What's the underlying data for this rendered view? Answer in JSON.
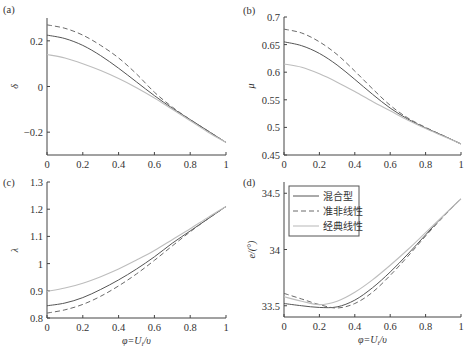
{
  "chart_data": [
    {
      "type": "line",
      "panel_label": "(a)",
      "title": "",
      "xlabel": "",
      "ylabel": "δ",
      "xlim": [
        0,
        1
      ],
      "ylim": [
        -0.3,
        0.3
      ],
      "xticks": [
        "0",
        "0.2",
        "0.4",
        "0.6",
        "0.8",
        "1"
      ],
      "yticks": [
        {
          "v": 0.2,
          "label": "0.2"
        },
        {
          "v": 0,
          "label": "0"
        },
        {
          "v": -0.2,
          "label": "−0.2"
        }
      ],
      "x": [
        0,
        0.1,
        0.2,
        0.3,
        0.4,
        0.5,
        0.6,
        0.7,
        0.8,
        0.9,
        1.0
      ],
      "series": [
        {
          "name": "混合型",
          "style": "solid",
          "values": [
            0.225,
            0.21,
            0.18,
            0.135,
            0.08,
            0.02,
            -0.04,
            -0.095,
            -0.145,
            -0.195,
            -0.245
          ]
        },
        {
          "name": "准非线性",
          "style": "dashed",
          "values": [
            0.27,
            0.255,
            0.225,
            0.18,
            0.125,
            0.055,
            -0.025,
            -0.09,
            -0.145,
            -0.195,
            -0.245
          ]
        },
        {
          "name": "经典线性",
          "style": "dotted",
          "values": [
            0.14,
            0.125,
            0.1,
            0.07,
            0.035,
            -0.005,
            -0.05,
            -0.1,
            -0.15,
            -0.2,
            -0.245
          ]
        }
      ]
    },
    {
      "type": "line",
      "panel_label": "(b)",
      "title": "",
      "xlabel": "",
      "ylabel": "μ",
      "xlim": [
        0,
        1
      ],
      "ylim": [
        0.45,
        0.7
      ],
      "xticks": [
        "0",
        "0.2",
        "0.4",
        "0.6",
        "0.8",
        "1"
      ],
      "yticks": [
        {
          "v": 0.7,
          "label": "0.7"
        },
        {
          "v": 0.65,
          "label": "0.65"
        },
        {
          "v": 0.6,
          "label": "0.6"
        },
        {
          "v": 0.55,
          "label": "0.55"
        },
        {
          "v": 0.5,
          "label": "0.5"
        },
        {
          "v": 0.45,
          "label": "0.45"
        }
      ],
      "x": [
        0,
        0.1,
        0.2,
        0.3,
        0.4,
        0.5,
        0.6,
        0.7,
        0.8,
        0.9,
        1.0
      ],
      "series": [
        {
          "name": "混合型",
          "style": "solid",
          "values": [
            0.655,
            0.648,
            0.634,
            0.613,
            0.587,
            0.56,
            0.535,
            0.515,
            0.499,
            0.485,
            0.47
          ]
        },
        {
          "name": "准非线性",
          "style": "dashed",
          "values": [
            0.678,
            0.671,
            0.655,
            0.632,
            0.602,
            0.57,
            0.54,
            0.517,
            0.5,
            0.485,
            0.47
          ]
        },
        {
          "name": "经典线性",
          "style": "dotted",
          "values": [
            0.615,
            0.609,
            0.597,
            0.582,
            0.565,
            0.547,
            0.53,
            0.513,
            0.498,
            0.484,
            0.47
          ]
        }
      ]
    },
    {
      "type": "line",
      "panel_label": "(c)",
      "title": "",
      "xlabel": "φ=U_i/υ",
      "ylabel": "λ",
      "xlim": [
        0,
        1
      ],
      "ylim": [
        0.8,
        1.3
      ],
      "xticks": [
        "0",
        "0.2",
        "0.4",
        "0.6",
        "0.8",
        "1"
      ],
      "yticks": [
        {
          "v": 1.3,
          "label": "1.3"
        },
        {
          "v": 1.2,
          "label": "1.2"
        },
        {
          "v": 1.1,
          "label": "1.1"
        },
        {
          "v": 1.0,
          "label": "1"
        },
        {
          "v": 0.9,
          "label": "0.9"
        },
        {
          "v": 0.8,
          "label": "0.8"
        }
      ],
      "x": [
        0,
        0.1,
        0.2,
        0.3,
        0.4,
        0.5,
        0.6,
        0.7,
        0.8,
        0.9,
        1.0
      ],
      "series": [
        {
          "name": "混合型",
          "style": "solid",
          "values": [
            0.845,
            0.855,
            0.875,
            0.905,
            0.94,
            0.98,
            1.025,
            1.075,
            1.12,
            1.165,
            1.21
          ]
        },
        {
          "name": "准非线性",
          "style": "dashed",
          "values": [
            0.818,
            0.83,
            0.85,
            0.88,
            0.918,
            0.962,
            1.012,
            1.065,
            1.117,
            1.165,
            1.21
          ]
        },
        {
          "name": "经典线性",
          "style": "dotted",
          "values": [
            0.898,
            0.91,
            0.928,
            0.952,
            0.98,
            1.013,
            1.048,
            1.088,
            1.128,
            1.17,
            1.21
          ]
        }
      ]
    },
    {
      "type": "line",
      "panel_label": "(d)",
      "title": "",
      "xlabel": "φ=U_i/υ",
      "ylabel": "e/(°)",
      "xlim": [
        0,
        1
      ],
      "ylim": [
        33.4,
        34.6
      ],
      "xticks": [
        "0",
        "0.2",
        "0.4",
        "0.6",
        "0.8",
        "1"
      ],
      "yticks": [
        {
          "v": 34.5,
          "label": "34.5"
        },
        {
          "v": 34.0,
          "label": "34"
        },
        {
          "v": 33.5,
          "label": "33.5"
        }
      ],
      "x": [
        0,
        0.1,
        0.2,
        0.3,
        0.4,
        0.5,
        0.6,
        0.7,
        0.8,
        0.9,
        1.0
      ],
      "series": [
        {
          "name": "混合型",
          "style": "solid",
          "values": [
            33.52,
            33.5,
            33.485,
            33.49,
            33.55,
            33.66,
            33.8,
            33.96,
            34.13,
            34.3,
            34.45
          ]
        },
        {
          "name": "准非线性",
          "style": "dashed",
          "values": [
            33.61,
            33.56,
            33.51,
            33.48,
            33.52,
            33.62,
            33.77,
            33.94,
            34.12,
            34.29,
            34.45
          ]
        },
        {
          "name": "经典线性",
          "style": "dotted",
          "values": [
            33.58,
            33.54,
            33.51,
            33.54,
            33.62,
            33.73,
            33.86,
            34.0,
            34.15,
            34.3,
            34.45
          ]
        }
      ],
      "legend": {
        "placement": "top-left",
        "entries": [
          {
            "label": "混合型",
            "style": "solid"
          },
          {
            "label": "准非线性",
            "style": "dashed"
          },
          {
            "label": "经典线性",
            "style": "dotted"
          }
        ]
      }
    }
  ],
  "colors": {
    "solid": "#555555",
    "dashed": "#6a6a6a",
    "dotted": "#bdbdbd",
    "axis": "#444444"
  }
}
